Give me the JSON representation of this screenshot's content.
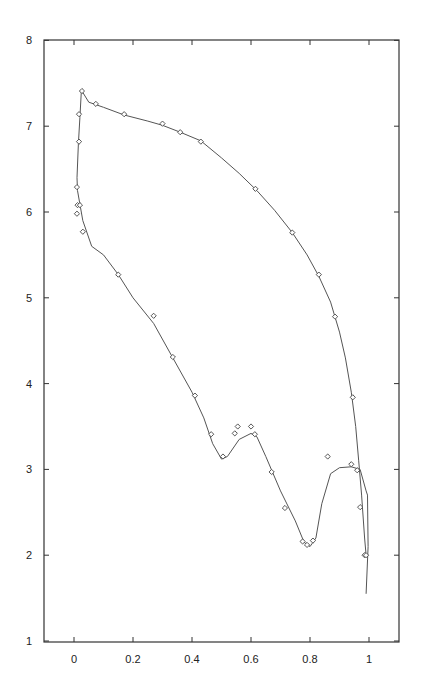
{
  "chart_data": {
    "type": "line",
    "title": "",
    "xlabel": "",
    "ylabel": "",
    "xlim": [
      -0.17,
      1.11
    ],
    "ylim": [
      1,
      8
    ],
    "grid": false,
    "legend": null,
    "x_ticks": [
      0,
      0.2,
      0.4,
      0.6,
      0.8,
      1
    ],
    "x_tick_labels": [
      "0",
      "0.2",
      "0.4",
      "0.6",
      "0.8",
      "1"
    ],
    "y_ticks": [
      1,
      2,
      3,
      4,
      5,
      6,
      7,
      8
    ],
    "y_tick_labels": [
      "1",
      "2",
      "3",
      "4",
      "5",
      "6",
      "7",
      "8"
    ],
    "series": [
      {
        "name": "upper-fit-curve",
        "kind": "line",
        "x": [
          0.025,
          0.05,
          0.1,
          0.17,
          0.25,
          0.3,
          0.36,
          0.43,
          0.5,
          0.56,
          0.62,
          0.68,
          0.74,
          0.79,
          0.83,
          0.87,
          0.9,
          0.92,
          0.94,
          0.955,
          0.965,
          0.975,
          0.985,
          0.99
        ],
        "y": [
          7.42,
          7.28,
          7.22,
          7.13,
          7.06,
          7.01,
          6.93,
          6.83,
          6.63,
          6.45,
          6.25,
          6.02,
          5.76,
          5.5,
          5.25,
          4.95,
          4.6,
          4.3,
          3.9,
          3.5,
          3.1,
          2.7,
          2.2,
          2.0
        ]
      },
      {
        "name": "lower-fit-curve",
        "kind": "line",
        "x": [
          0.025,
          0.02,
          0.015,
          0.01,
          0.012,
          0.03,
          0.06,
          0.1,
          0.15,
          0.2,
          0.27,
          0.33,
          0.4,
          0.44,
          0.47,
          0.5,
          0.52,
          0.56,
          0.6,
          0.62,
          0.65,
          0.7,
          0.75,
          0.78,
          0.8,
          0.82,
          0.84,
          0.87,
          0.9,
          0.94,
          0.97,
          0.99,
          0.995,
          0.997,
          0.99
        ],
        "y": [
          7.42,
          7.1,
          6.8,
          6.4,
          6.25,
          5.9,
          5.6,
          5.5,
          5.27,
          5.0,
          4.7,
          4.33,
          3.9,
          3.6,
          3.3,
          3.12,
          3.15,
          3.35,
          3.42,
          3.38,
          3.15,
          2.75,
          2.4,
          2.15,
          2.1,
          2.2,
          2.6,
          2.95,
          3.02,
          3.03,
          3.0,
          2.75,
          2.7,
          2.1,
          1.55
        ]
      },
      {
        "name": "data-points",
        "kind": "scatter",
        "marker": "diamond-open",
        "x": [
          0.027,
          0.074,
          0.17,
          0.3,
          0.36,
          0.43,
          0.615,
          0.74,
          0.83,
          0.885,
          0.945,
          0.017,
          0.017,
          0.01,
          0.012,
          0.02,
          0.01,
          0.03,
          0.15,
          0.27,
          0.335,
          0.41,
          0.465,
          0.505,
          0.545,
          0.555,
          0.6,
          0.613,
          0.67,
          0.715,
          0.775,
          0.79,
          0.81,
          0.86,
          0.94,
          0.96,
          0.97,
          0.985,
          0.99
        ],
        "y": [
          7.41,
          7.26,
          7.14,
          7.03,
          6.93,
          6.82,
          6.27,
          5.76,
          5.27,
          4.78,
          3.84,
          7.14,
          6.82,
          6.29,
          6.08,
          6.08,
          5.98,
          5.77,
          5.27,
          4.79,
          4.31,
          3.86,
          3.41,
          3.15,
          3.42,
          3.5,
          3.5,
          3.41,
          2.97,
          2.55,
          2.16,
          2.12,
          2.17,
          3.15,
          3.06,
          2.99,
          2.56,
          2.0,
          2.0
        ]
      }
    ],
    "plot_area_px": {
      "left": 44,
      "top": 40,
      "right": 399,
      "bottom": 642
    },
    "axis_map_px": {
      "x0": 74,
      "x_unit": 295,
      "y1": 641,
      "y_unit": 85.8
    }
  }
}
